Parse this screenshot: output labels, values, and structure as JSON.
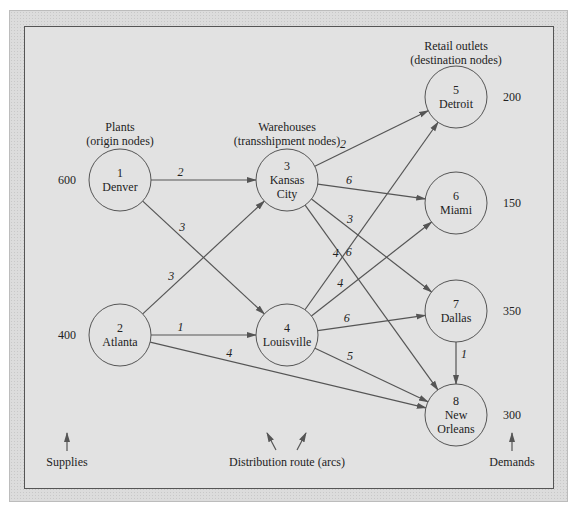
{
  "groups": {
    "plants": {
      "title": "Plants",
      "subtitle": "(origin nodes)"
    },
    "warehouses": {
      "title": "Warehouses",
      "subtitle": "(transshipment nodes)"
    },
    "retail": {
      "title": "Retail outlets",
      "subtitle": "(destination nodes)"
    }
  },
  "nodes": [
    {
      "id": "1",
      "name": "Denver",
      "name2": "",
      "x": 120,
      "y": 180,
      "value": "600"
    },
    {
      "id": "2",
      "name": "Atlanta",
      "name2": "",
      "x": 120,
      "y": 335,
      "value": "400"
    },
    {
      "id": "3",
      "name": "Kansas",
      "name2": "City",
      "x": 287,
      "y": 180,
      "value": ""
    },
    {
      "id": "4",
      "name": "Louisville",
      "name2": "",
      "x": 287,
      "y": 335,
      "value": ""
    },
    {
      "id": "5",
      "name": "Detroit",
      "name2": "",
      "x": 456,
      "y": 97,
      "value": "200"
    },
    {
      "id": "6",
      "name": "Miami",
      "name2": "",
      "x": 456,
      "y": 203,
      "value": "150"
    },
    {
      "id": "7",
      "name": "Dallas",
      "name2": "",
      "x": 456,
      "y": 311,
      "value": "350"
    },
    {
      "id": "8",
      "name": "New",
      "name2": "Orleans",
      "x": 456,
      "y": 415,
      "value": "300"
    }
  ],
  "arcs": [
    {
      "from": "1",
      "to": "3",
      "cost": "2"
    },
    {
      "from": "1",
      "to": "4",
      "cost": "3"
    },
    {
      "from": "2",
      "to": "3",
      "cost": "3"
    },
    {
      "from": "2",
      "to": "4",
      "cost": "1"
    },
    {
      "from": "2",
      "to": "8",
      "cost": "4"
    },
    {
      "from": "3",
      "to": "5",
      "cost": "2"
    },
    {
      "from": "3",
      "to": "6",
      "cost": "6"
    },
    {
      "from": "3",
      "to": "7",
      "cost": "3"
    },
    {
      "from": "3",
      "to": "8",
      "cost": "6"
    },
    {
      "from": "4",
      "to": "5",
      "cost": "4"
    },
    {
      "from": "4",
      "to": "6",
      "cost": "4"
    },
    {
      "from": "4",
      "to": "7",
      "cost": "6"
    },
    {
      "from": "4",
      "to": "8",
      "cost": "5"
    },
    {
      "from": "7",
      "to": "8",
      "cost": "1"
    }
  ],
  "legend": {
    "supplies": "Supplies",
    "routes": "Distribution route (arcs)",
    "demands": "Demands"
  }
}
